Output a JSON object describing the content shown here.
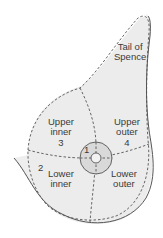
{
  "diagram": {
    "colors": {
      "background": "#ffffff",
      "breast_fill": "#eeeeee",
      "areola_fill": "#d9d9d9",
      "outline": "#555555",
      "dashed": "#555555",
      "text": "#3a3a3a"
    },
    "labels": {
      "tail": {
        "line1": "Tail of",
        "line2": "Spence"
      },
      "upper_inner": {
        "line1": "Upper",
        "line2": "inner",
        "number": "3"
      },
      "upper_outer": {
        "line1": "Upper",
        "line2": "outer",
        "number": "4"
      },
      "lower_inner": {
        "line1": "Lower",
        "line2": "inner",
        "number": "2"
      },
      "lower_outer": {
        "line1": "Lower",
        "line2": "outer"
      },
      "central": {
        "number": "1"
      }
    }
  }
}
